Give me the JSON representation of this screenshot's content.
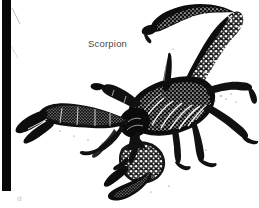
{
  "figure": {
    "width": 259,
    "height": 208,
    "background_color": "#ffffff",
    "ink_color": "#101010",
    "caption_color": "#4a4a4a",
    "artifact_color": "#080808",
    "label": "Scorpion",
    "panel_letter": "d",
    "style": "black-and-white halftone scan",
    "parts": {
      "tail": "telson-and-metasoma-arching-over-body",
      "stinger": "aculeus",
      "left_pincer": "left-pedipalp-chela",
      "lower_pincer": "right-pedipalp-chela",
      "legs": "walking-legs",
      "body": "mesosoma-and-prosoma"
    }
  }
}
